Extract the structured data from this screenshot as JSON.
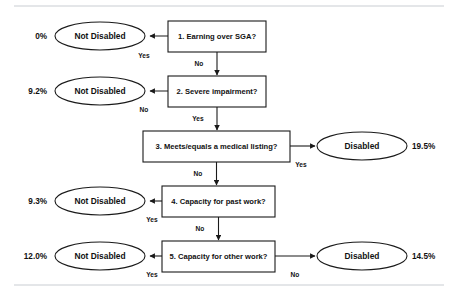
{
  "diagram": {
    "type": "flowchart",
    "steps": [
      {
        "id": "step1",
        "label": "1. Earning over SGA?",
        "yes_label": "Yes",
        "no_label": "No",
        "yes_outcome": "Not Disabled",
        "yes_percent": "0%",
        "no_target": "step2"
      },
      {
        "id": "step2",
        "label": "2. Severe impairment?",
        "yes_label": "Yes",
        "no_label": "No",
        "no_outcome": "Not Disabled",
        "no_percent": "9.2%",
        "yes_target": "step3"
      },
      {
        "id": "step3",
        "label": "3. Meets/equals a medical listing?",
        "yes_label": "Yes",
        "no_label": "No",
        "yes_outcome": "Disabled",
        "yes_percent": "19.5%",
        "no_target": "step4"
      },
      {
        "id": "step4",
        "label": "4. Capacity for past work?",
        "yes_label": "Yes",
        "no_label": "No",
        "yes_outcome": "Not Disabled",
        "yes_percent": "9.3%",
        "no_target": "step5"
      },
      {
        "id": "step5",
        "label": "5. Capacity for other work?",
        "yes_label": "Yes",
        "no_label": "No",
        "yes_outcome": "Not Disabled",
        "yes_percent": "12.0%",
        "no_outcome": "Disabled",
        "no_percent": "14.5%"
      }
    ],
    "terminals": {
      "not_disabled": "Not Disabled",
      "disabled": "Disabled"
    },
    "colors": {
      "stroke": "#1a1a1a",
      "fill": "#ffffff",
      "rule": "#c9cdd2"
    }
  }
}
